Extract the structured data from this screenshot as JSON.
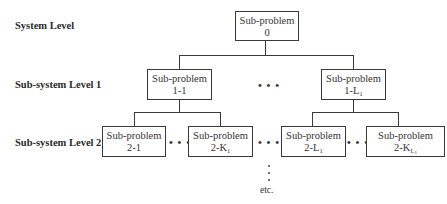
{
  "diagram": {
    "levels": [
      {
        "label": "System Level"
      },
      {
        "label": "Sub-system Level 1"
      },
      {
        "label": "Sub-system Level 2"
      }
    ],
    "nodes": {
      "root": {
        "title": "Sub-problem",
        "id": "0"
      },
      "l1_first": {
        "title": "Sub-problem",
        "id": "1-1"
      },
      "l1_last": {
        "title": "Sub-problem",
        "id_prefix": "1-L",
        "id_sub": "1"
      },
      "l2_a": {
        "title": "Sub-problem",
        "id": "2-1"
      },
      "l2_b": {
        "title": "Sub-problem",
        "id_prefix": "2-K",
        "id_sub": "1"
      },
      "l2_c": {
        "title": "Sub-problem",
        "id_prefix": "2-L",
        "id_sub": "1"
      },
      "l2_d": {
        "title": "Sub-problem",
        "id_prefix": "2-K",
        "id_sub": "L",
        "id_subsub": "1"
      }
    },
    "ellipsis": "• • •",
    "continuation": "etc."
  }
}
